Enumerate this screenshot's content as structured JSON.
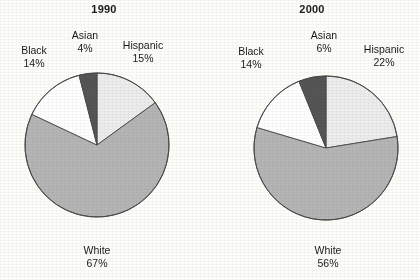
{
  "figure": {
    "background": "#fdfdfa",
    "ink": "#231f20"
  },
  "palette": {
    "hispanic": "#ededed",
    "white": "#b5b5b5",
    "black": "#ffffff",
    "asian": "#555555",
    "outline": "#4a4a4a"
  },
  "chart_data": [
    {
      "type": "pie",
      "title": "1990",
      "categories": [
        "Hispanic",
        "White",
        "Black",
        "Asian"
      ],
      "values": [
        15,
        67,
        14,
        4
      ],
      "value_suffix": "%",
      "start_angle": 0,
      "direction": "clockwise",
      "colors": [
        "#ededed",
        "#b5b5b5",
        "#ffffff",
        "#555555"
      ],
      "labels": [
        {
          "name": "Hispanic",
          "value": "15%"
        },
        {
          "name": "White",
          "value": "67%"
        },
        {
          "name": "Black",
          "value": "14%"
        },
        {
          "name": "Asian",
          "value": "4%"
        }
      ],
      "legend": "none",
      "grid": false
    },
    {
      "type": "pie",
      "title": "2000",
      "categories": [
        "Hispanic",
        "White",
        "Black",
        "Asian"
      ],
      "values": [
        22,
        56,
        14,
        6
      ],
      "value_suffix": "%",
      "start_angle": 0,
      "direction": "clockwise",
      "colors": [
        "#ededed",
        "#b5b5b5",
        "#ffffff",
        "#555555"
      ],
      "labels": [
        {
          "name": "Hispanic",
          "value": "22%"
        },
        {
          "name": "White",
          "value": "56%"
        },
        {
          "name": "Black",
          "value": "14%"
        },
        {
          "name": "Asian",
          "value": "6%"
        }
      ],
      "legend": "none",
      "grid": false
    }
  ],
  "panels": [
    {
      "title": "1990",
      "labels": {
        "black": {
          "name": "Black",
          "value": "14%"
        },
        "asian": {
          "name": "Asian",
          "value": "4%"
        },
        "hispanic": {
          "name": "Hispanic",
          "value": "15%"
        },
        "white": {
          "name": "White",
          "value": "67%"
        }
      }
    },
    {
      "title": "2000",
      "labels": {
        "black": {
          "name": "Black",
          "value": "14%"
        },
        "asian": {
          "name": "Asian",
          "value": "6%"
        },
        "hispanic": {
          "name": "Hispanic",
          "value": "22%"
        },
        "white": {
          "name": "White",
          "value": "56%"
        }
      }
    }
  ]
}
